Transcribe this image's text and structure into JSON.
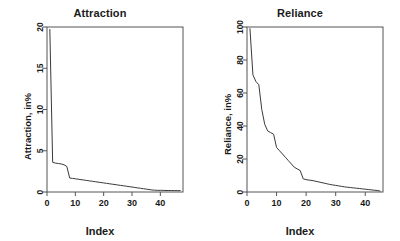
{
  "figure": {
    "background_color": "#ffffff",
    "line_color": "#3a3a3a",
    "axis_color": "#555555",
    "text_color": "#1a1a1a"
  },
  "chart_data": [
    {
      "type": "line",
      "title": "Attraction",
      "xlabel": "Index",
      "ylabel": "Attraction, in%",
      "xlim": [
        0,
        48
      ],
      "ylim": [
        0,
        20
      ],
      "xticks": [
        0,
        10,
        20,
        30,
        40
      ],
      "yticks": [
        0,
        5,
        10,
        15,
        20
      ],
      "grid": false,
      "legend": "none",
      "x": [
        1,
        2,
        3,
        4,
        5,
        6,
        7,
        8,
        9,
        10,
        11,
        12,
        13,
        14,
        15,
        16,
        17,
        18,
        19,
        20,
        21,
        22,
        23,
        24,
        25,
        26,
        27,
        28,
        29,
        30,
        31,
        32,
        33,
        34,
        35,
        36,
        37,
        38,
        39,
        40,
        41,
        42,
        43,
        44,
        45,
        46,
        47
      ],
      "values": [
        19.7,
        3.6,
        3.5,
        3.45,
        3.4,
        3.3,
        3.1,
        1.7,
        1.65,
        1.6,
        1.55,
        1.5,
        1.45,
        1.4,
        1.35,
        1.3,
        1.25,
        1.2,
        1.15,
        1.1,
        1.05,
        1.0,
        0.95,
        0.9,
        0.85,
        0.8,
        0.75,
        0.7,
        0.65,
        0.6,
        0.55,
        0.5,
        0.45,
        0.4,
        0.35,
        0.3,
        0.25,
        0.22,
        0.2,
        0.2,
        0.2,
        0.18,
        0.18,
        0.18,
        0.17,
        0.17,
        0.17
      ]
    },
    {
      "type": "line",
      "title": "Reliance",
      "xlabel": "Index",
      "ylabel": "Reliance, in%",
      "xlim": [
        0,
        46
      ],
      "ylim": [
        0,
        100
      ],
      "xticks": [
        0,
        10,
        20,
        30,
        40
      ],
      "yticks": [
        0,
        20,
        40,
        60,
        80,
        100
      ],
      "grid": false,
      "legend": "none",
      "x": [
        1,
        2,
        3,
        4,
        5,
        6,
        7,
        8,
        9,
        10,
        11,
        12,
        13,
        14,
        15,
        16,
        17,
        18,
        19,
        20,
        21,
        22,
        23,
        24,
        25,
        26,
        27,
        28,
        29,
        30,
        31,
        32,
        33,
        34,
        35,
        36,
        37,
        38,
        39,
        40,
        41,
        42,
        43,
        44,
        45
      ],
      "values": [
        99,
        71,
        67,
        65,
        50,
        41,
        37,
        36,
        35,
        27,
        25,
        23,
        21,
        19,
        17,
        15,
        14,
        13,
        8,
        7.5,
        7.2,
        7.0,
        6.6,
        6.2,
        5.8,
        5.4,
        5.0,
        4.6,
        4.3,
        4.0,
        3.7,
        3.4,
        3.1,
        2.9,
        2.7,
        2.5,
        2.3,
        2.1,
        1.9,
        1.7,
        1.5,
        1.3,
        1.1,
        0.9,
        0.6
      ]
    }
  ]
}
